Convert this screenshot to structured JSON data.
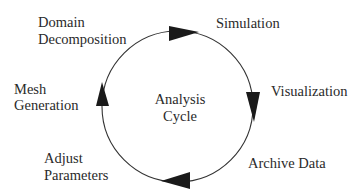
{
  "diagram": {
    "center_label": {
      "line1": "Analysis",
      "line2": "Cycle"
    },
    "stages": [
      {
        "id": "domain-decomposition",
        "line1": "Domain",
        "line2": "Decomposition"
      },
      {
        "id": "simulation",
        "line1": "Simulation"
      },
      {
        "id": "visualization",
        "line1": "Visualization"
      },
      {
        "id": "archive-data",
        "line1": "Archive Data"
      },
      {
        "id": "adjust-parameters",
        "line1": "Adjust",
        "line2": "Parameters"
      },
      {
        "id": "mesh-generation",
        "line1": "Mesh",
        "line2": "Generation"
      }
    ],
    "flow_direction": "clockwise",
    "colors": {
      "circle": "#333333",
      "arrow": "#1a1a1a",
      "text": "#2a2a2a",
      "background": "#ffffff"
    }
  }
}
